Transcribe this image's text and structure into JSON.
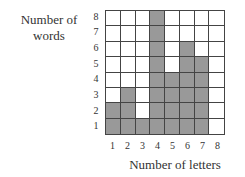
{
  "chart_data": {
    "type": "bar",
    "title": "",
    "xlabel": "Number of letters",
    "ylabel": "Number of words",
    "categories": [
      "1",
      "2",
      "3",
      "4",
      "5",
      "6",
      "7",
      "8"
    ],
    "values": [
      2,
      3,
      1,
      8,
      4,
      6,
      5,
      0
    ],
    "x_tick_labels": [
      "1",
      "2",
      "3",
      "4",
      "5",
      "6",
      "7",
      "8"
    ],
    "y_tick_labels": [
      "1",
      "2",
      "3",
      "4",
      "5",
      "6",
      "7",
      "8"
    ],
    "ylim": [
      0,
      8
    ],
    "grid": true,
    "style": "shaded grid cells (histogram on squared grid)",
    "bar_color": "#999999"
  },
  "labels": {
    "ylabel_line1": "Number of",
    "ylabel_line2": "words",
    "xlabel": "Number of letters"
  }
}
